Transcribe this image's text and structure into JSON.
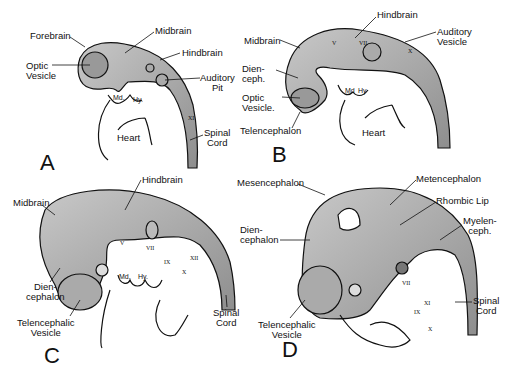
{
  "figure": {
    "colors": {
      "tissue": "#b3b3b3",
      "tissue_dark": "#7a7a7a",
      "outline": "#111111",
      "background": "#ffffff"
    },
    "panels": [
      {
        "letter": "A",
        "labels": {
          "forebrain": "Forebrain",
          "midbrain": "Midbrain",
          "hindbrain": "Hindbrain",
          "optic_vesicle": "Optic\nVesicle",
          "auditory_pit": "Auditory\nPit",
          "md": "Md.",
          "hy": "Hy.",
          "heart": "Heart",
          "spinal_cord": "Spinal\nCord",
          "nerve_xi": "XI"
        }
      },
      {
        "letter": "B",
        "labels": {
          "hindbrain": "Hindbrain",
          "auditory_vesicle": "Auditory\nVesicle",
          "midbrain": "Midbrain",
          "diencephalon": "Dien-\nceph.",
          "optic_vesicle": "Optic\nVesicle.",
          "telencephalon": "Telencephalon",
          "md": "Md",
          "hy": "Hy",
          "heart": "Heart",
          "nerve_v": "V",
          "nerve_vii": "VII",
          "nerve_x": "X"
        }
      },
      {
        "letter": "C",
        "labels": {
          "hindbrain": "Hindbrain",
          "midbrain": "Midbrain",
          "diencephalon": "Dien-\ncephalon",
          "telencephalic_vesicle": "Telencephalic\nVesicle",
          "spinal_cord": "Spinal\nCord",
          "md": "Md.",
          "hy": "Hy.",
          "nerve_v": "V",
          "nerve_vii": "VII",
          "nerve_ix": "IX",
          "nerve_x": "X",
          "nerve_xii": "XII"
        }
      },
      {
        "letter": "D",
        "labels": {
          "mesencephalon": "Mesencephalon",
          "metencephalon": "Metencephalon",
          "rhombic_lip": "Rhombic Lip",
          "myelenceph": "Myelen-\nceph.",
          "diencephalon": "Dien-\ncephalon",
          "telencephalic_vesicle": "Telencephalic\nVesicle",
          "spinal_cord": "Spinal\nCord",
          "nerve_vii": "VII",
          "nerve_ix": "IX",
          "nerve_x": "X",
          "nerve_xi": "XI"
        }
      }
    ]
  }
}
